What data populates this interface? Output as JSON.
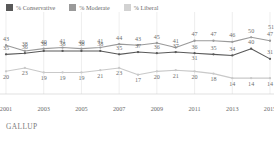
{
  "source": "GALLUP",
  "legend": {
    "position": "top-left",
    "items": [
      {
        "label": "% Conservative",
        "color": "#595959",
        "name": "legend-conservative"
      },
      {
        "label": "% Moderate",
        "color": "#9a9a9a",
        "name": "legend-moderate"
      },
      {
        "label": "% Liberal",
        "color": "#d2d2d2",
        "name": "legend-liberal"
      }
    ]
  },
  "chart_data": {
    "type": "line",
    "title": "",
    "subtitle": "",
    "xlabel": "",
    "ylabel": "",
    "grid": "vertical-only",
    "ylim": [
      0,
      60
    ],
    "xlim": [
      2001,
      2015
    ],
    "x": [
      2001,
      2002,
      2003,
      2004,
      2005,
      2006,
      2007,
      2008,
      2009,
      2010,
      2011,
      2012,
      2013,
      2014,
      2015
    ],
    "tick_labels": [
      "2001",
      "2003",
      "2005",
      "2007",
      "2009",
      "2011",
      "2013",
      "2015"
    ],
    "tick_values": [
      2001,
      2003,
      2005,
      2007,
      2009,
      2011,
      2013,
      2015
    ],
    "series": [
      {
        "name": "% Moderate",
        "color": "#9a9a9a",
        "values": [
          43,
          38,
          40,
          41,
          40,
          41,
          44,
          43,
          45,
          41,
          47,
          47,
          46,
          50,
          47
        ]
      },
      {
        "name": "% Conservative",
        "color": "#595959",
        "values": [
          35,
          36,
          38,
          38,
          38,
          38,
          35,
          37,
          36,
          37,
          36,
          35,
          34,
          40,
          31
        ]
      },
      {
        "name": "% Liberal",
        "color": "#c9c9c9",
        "values": [
          20,
          23,
          19,
          19,
          19,
          21,
          23,
          17,
          20,
          21,
          20,
          18,
          14,
          14,
          14
        ]
      }
    ],
    "annotations": [
      {
        "text": "51",
        "series": "% Moderate",
        "x": 2015,
        "note": "top-right peak label"
      },
      {
        "text": "31",
        "series": "% Liberal",
        "x": 2011,
        "note": "mid peak label"
      }
    ]
  }
}
